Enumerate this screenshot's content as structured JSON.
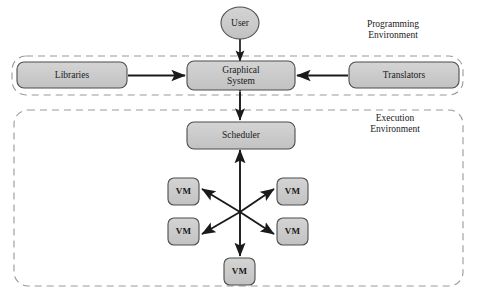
{
  "diagram": {
    "colors": {
      "node_fill": "#cccccc",
      "node_stroke": "#4d4d4d",
      "arrow": "#1a1a1a",
      "env_border": "#999999",
      "text": "#1a1a1a",
      "background": "#ffffff"
    },
    "nodes": [
      {
        "id": "user",
        "label": "User",
        "shape": "ellipse",
        "x": 240,
        "y": 23,
        "rx": 19,
        "ry": 16
      },
      {
        "id": "libraries",
        "label": "Libraries",
        "shape": "rounded-rect",
        "x": 17,
        "y": 62,
        "w": 110,
        "h": 26
      },
      {
        "id": "graphical-system",
        "label": "Graphical\nSystem",
        "shape": "rounded-rect",
        "x": 187,
        "y": 62,
        "w": 108,
        "h": 28
      },
      {
        "id": "translators",
        "label": "Translators",
        "shape": "rounded-rect",
        "x": 349,
        "y": 62,
        "w": 110,
        "h": 26
      },
      {
        "id": "scheduler",
        "label": "Scheduler",
        "shape": "rounded-rect",
        "x": 187,
        "y": 122,
        "w": 108,
        "h": 26
      },
      {
        "id": "vm-top-left",
        "label": "VM",
        "shape": "rounded-rect",
        "x": 168,
        "y": 178,
        "w": 31,
        "h": 27
      },
      {
        "id": "vm-top-right",
        "label": "VM",
        "shape": "rounded-rect",
        "x": 277,
        "y": 178,
        "w": 31,
        "h": 27
      },
      {
        "id": "vm-bottom-left",
        "label": "VM",
        "shape": "rounded-rect",
        "x": 168,
        "y": 218,
        "w": 31,
        "h": 27
      },
      {
        "id": "vm-bottom-right",
        "label": "VM",
        "shape": "rounded-rect",
        "x": 277,
        "y": 218,
        "w": 31,
        "h": 27
      },
      {
        "id": "vm-bottom-center",
        "label": "VM",
        "shape": "rounded-rect",
        "x": 224,
        "y": 258,
        "w": 31,
        "h": 27
      }
    ],
    "environments": [
      {
        "id": "programming-environment",
        "label": "Programming\nEnvironment",
        "x": 12,
        "y": 56,
        "w": 451,
        "h": 39,
        "label_x": 370,
        "label_y": 26
      },
      {
        "id": "execution-environment",
        "label": "Execution\nEnvironment",
        "x": 14,
        "y": 110,
        "w": 449,
        "h": 176,
        "label_x": 372,
        "label_y": 112
      }
    ],
    "connections": [
      {
        "id": "user-to-graphical-system",
        "from": "user",
        "to": "graphical-system",
        "direction": "down",
        "arrowheads": "single"
      },
      {
        "id": "libraries-to-graphical-system",
        "from": "libraries",
        "to": "graphical-system",
        "direction": "right",
        "arrowheads": "single"
      },
      {
        "id": "translators-to-graphical-system",
        "from": "translators",
        "to": "graphical-system",
        "direction": "left",
        "arrowheads": "single"
      },
      {
        "id": "graphical-system-to-scheduler",
        "from": "graphical-system",
        "to": "scheduler",
        "direction": "bidirectional",
        "arrowheads": "double"
      },
      {
        "id": "hub-to-scheduler",
        "from": "vm-hub",
        "to": "scheduler",
        "direction": "up",
        "arrowheads": "single"
      },
      {
        "id": "hub-to-vm-bottom-center",
        "from": "vm-hub",
        "to": "vm-bottom-center",
        "direction": "down",
        "arrowheads": "single"
      },
      {
        "id": "hub-to-vm-top-left",
        "from": "vm-hub",
        "to": "vm-top-left",
        "direction": "up-left",
        "arrowheads": "single"
      },
      {
        "id": "hub-to-vm-top-right",
        "from": "vm-hub",
        "to": "vm-top-right",
        "direction": "up-right",
        "arrowheads": "single"
      },
      {
        "id": "hub-to-vm-bottom-left",
        "from": "vm-hub",
        "to": "vm-bottom-left",
        "direction": "down-left",
        "arrowheads": "single"
      },
      {
        "id": "hub-to-vm-bottom-right",
        "from": "vm-hub",
        "to": "vm-bottom-right",
        "direction": "down-right",
        "arrowheads": "single"
      }
    ]
  }
}
